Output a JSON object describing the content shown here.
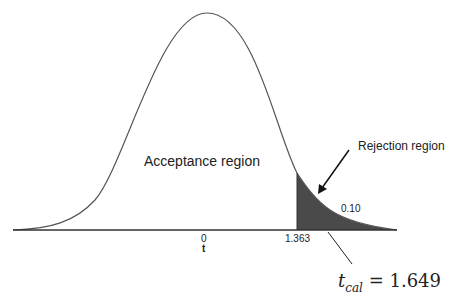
{
  "diagram": {
    "type": "t-distribution rejection region",
    "labels": {
      "acceptance": "Acceptance region",
      "rejection": "Rejection region",
      "alpha": "0.10",
      "center_tick": "0",
      "critical_tick": "1.363",
      "axis_variable": "t",
      "tcal_symbol": "t",
      "tcal_subscript": "cal",
      "tcal_value": "= 1.649"
    },
    "colors": {
      "curve": "#555555",
      "shaded": "#4a4a4a",
      "axis": "#333333",
      "arrow": "#111111"
    },
    "values": {
      "critical_t": 1.363,
      "calculated_t": 1.649,
      "alpha": 0.1
    }
  }
}
